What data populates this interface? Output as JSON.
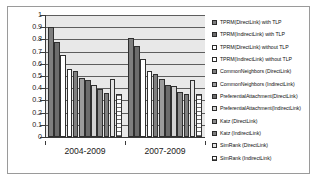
{
  "chart_data": {
    "type": "bar",
    "title": "",
    "xlabel": "",
    "ylabel": "",
    "ylim": [
      0,
      1
    ],
    "yticks": [
      "1",
      "0.9",
      "0.8",
      "0.7",
      "0.6",
      "0.5",
      "0.4",
      "0.3",
      "0.2",
      "0.1",
      "0"
    ],
    "grid": true,
    "legend_position": "right",
    "categories": [
      "2004-2009",
      "2007-2009"
    ],
    "series": [
      {
        "name": "TPRM(DirectLink) with TLP",
        "values": [
          0.9,
          0.815
        ],
        "fill": "f-dk"
      },
      {
        "name": "TPRM(IndirectLink) with TLP",
        "values": [
          0.78,
          0.75
        ],
        "fill": "f-dk2"
      },
      {
        "name": "TPRM(DirectLink) without TLP",
        "values": [
          0.67,
          0.64
        ],
        "fill": "f-wh"
      },
      {
        "name": "TPRM(IndirectLink) without TLP",
        "values": [
          0.56,
          0.54
        ],
        "fill": "f-wh"
      },
      {
        "name": "CommonNeighbors (DirectLink)",
        "values": [
          0.545,
          0.515
        ],
        "fill": "f-dk"
      },
      {
        "name": "CommonNeighbors (IndirectLink)",
        "values": [
          0.48,
          0.475
        ],
        "fill": "f-md"
      },
      {
        "name": "PreferentialAttachment(DirectLink)",
        "values": [
          0.465,
          0.43
        ],
        "fill": "f-dk2"
      },
      {
        "name": "PreferentialAttachment(IndirectLink)",
        "values": [
          0.425,
          0.42
        ],
        "fill": "f-lt"
      },
      {
        "name": "Katz (DirectLink)",
        "values": [
          0.395,
          0.365
        ],
        "fill": "f-mid2"
      },
      {
        "name": "Katz (IndirectLink)",
        "values": [
          0.36,
          0.355
        ],
        "fill": "f-dk"
      },
      {
        "name": "SimRank (DirectLink)",
        "values": [
          0.475,
          0.47
        ],
        "fill": "f-vlt"
      },
      {
        "name": "SimRank (IndirectLink)",
        "values": [
          0.355,
          0.35
        ],
        "fill": "f-hatch"
      }
    ]
  }
}
